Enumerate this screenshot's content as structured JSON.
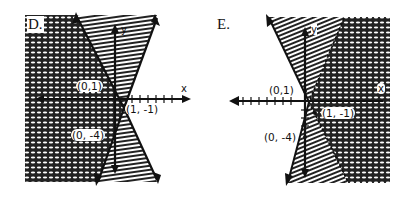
{
  "graphs": [
    {
      "label": "D.",
      "x_axis_label": "x",
      "y_axis_label": "y",
      "points": [
        {
          "label": "(0,1)",
          "x": 0,
          "y": 1
        },
        {
          "label": "(1, -1)",
          "x": 1,
          "y": -1
        },
        {
          "label": "(0, -4)",
          "x": 0,
          "y": -4
        }
      ],
      "regions": {
        "crosshatch": "left of both lines",
        "line_hatch": "right of both lines (between arrows)"
      }
    },
    {
      "label": "E.",
      "x_axis_label": "x",
      "y_axis_label": "y",
      "points": [
        {
          "label": "(0,1)",
          "x": 0,
          "y": 1
        },
        {
          "label": "(1, -1)",
          "x": 1,
          "y": -1
        },
        {
          "label": "(0, -4)",
          "x": 0,
          "y": -4
        }
      ],
      "regions": {
        "crosshatch": "right of both lines",
        "line_hatch": "left of both lines (between arrows)"
      }
    }
  ],
  "colors": {
    "ink": "#111111",
    "background": "#ffffff"
  }
}
